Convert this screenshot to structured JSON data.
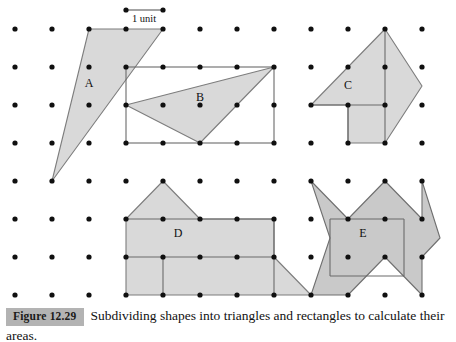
{
  "figure": {
    "badge_label": "Figure 12.29",
    "caption": "Subdividing shapes into triangles and rectangles to calculate their areas.",
    "unit_label": "1 unit",
    "shape_labels": {
      "a": "A",
      "b": "B",
      "c": "C",
      "d": "D",
      "e": "E"
    },
    "colors": {
      "shape_fill": "#d9d9d9",
      "shape_fill_dark": "#c9c9c9",
      "shape_stroke": "#7d7d7d",
      "dot": "#101010",
      "badge_background": "#b3b3b3",
      "badge_text": "#1a1a1a",
      "caption_text": "#111111"
    }
  },
  "chart_data": {
    "type": "diagram",
    "title": "Subdividing shapes into triangles and rectangles to calculate their areas.",
    "grid": {
      "origin_x": 15,
      "origin_y": 29,
      "spacing_x": 37,
      "spacing_y": 38,
      "cols": 13,
      "rows": 8,
      "dot_radius": 2.6
    },
    "scale_bar": {
      "label": "1 unit",
      "x1": 126,
      "x2": 163,
      "y": 10,
      "units": 1
    },
    "shapes": [
      {
        "id": "A",
        "label": "A",
        "type": "triangle",
        "label_pos": [
          89,
          84
        ],
        "points_px": [
          [
            89,
            29
          ],
          [
            163,
            29
          ],
          [
            52,
            181
          ]
        ],
        "subdivision_lines": []
      },
      {
        "id": "B",
        "label": "B",
        "type": "triangle-in-rectangle",
        "label_pos": [
          200,
          98
        ],
        "points_px": [
          [
            126,
            105
          ],
          [
            274,
            67
          ],
          [
            200,
            143
          ]
        ],
        "bounding_rect_px": [
          126,
          67,
          148,
          76
        ],
        "subdivision_lines": []
      },
      {
        "id": "C",
        "label": "C",
        "type": "polygon",
        "label_pos": [
          348,
          86
        ],
        "points_px": [
          [
            311,
            105
          ],
          [
            385,
            29
          ],
          [
            422,
            86
          ],
          [
            385,
            143
          ],
          [
            348,
            143
          ],
          [
            348,
            105
          ]
        ],
        "subdivision_lines": [
          [
            [
              311,
              105
            ],
            [
              385,
              105
            ]
          ],
          [
            [
              385,
              29
            ],
            [
              385,
              143
            ]
          ],
          [
            [
              348,
              105
            ],
            [
              348,
              143
            ]
          ]
        ]
      },
      {
        "id": "D",
        "label": "D",
        "type": "polygon",
        "label_pos": [
          178,
          234
        ],
        "points_px": [
          [
            126,
            219
          ],
          [
            163,
            181
          ],
          [
            200,
            219
          ],
          [
            274,
            219
          ],
          [
            274,
            257
          ],
          [
            311,
            295
          ],
          [
            126,
            295
          ],
          [
            126,
            219
          ]
        ],
        "subdivision_lines": [
          [
            [
              126,
              219
            ],
            [
              274,
              219
            ]
          ],
          [
            [
              274,
              219
            ],
            [
              274,
              295
            ]
          ],
          [
            [
              126,
              257
            ],
            [
              163,
              257
            ]
          ],
          [
            [
              163,
              257
            ],
            [
              163,
              295
            ]
          ],
          [
            [
              126,
              257
            ],
            [
              274,
              257
            ]
          ]
        ],
        "note": "House-like outline with roof triangle, main rectangle, right triangle flap and lower-left notch."
      },
      {
        "id": "E",
        "label": "E",
        "type": "star-polygon",
        "label_pos": [
          363,
          234
        ],
        "points_px": [
          [
            311,
            181
          ],
          [
            348,
            219
          ],
          [
            385,
            181
          ],
          [
            422,
            219
          ],
          [
            422,
            181
          ],
          [
            440,
            238
          ],
          [
            422,
            257
          ],
          [
            422,
            295
          ],
          [
            385,
            257
          ],
          [
            348,
            295
          ],
          [
            311,
            295
          ],
          [
            330,
            238
          ]
        ],
        "bounding_rect_px": [
          330,
          219,
          74,
          57
        ],
        "subdivision_lines": [
          [
            [
              330,
              219
            ],
            [
              404,
              219
            ]
          ],
          [
            [
              330,
              276
            ],
            [
              404,
              276
            ]
          ],
          [
            [
              330,
              219
            ],
            [
              330,
              276
            ]
          ],
          [
            [
              404,
              219
            ],
            [
              404,
              276
            ]
          ]
        ]
      }
    ],
    "xlabel": "",
    "ylabel": "",
    "legend": []
  }
}
